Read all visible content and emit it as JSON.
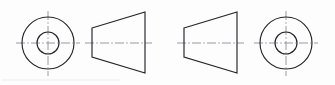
{
  "drawing": {
    "title": "Truncated cone with central bore — two orthographic projections",
    "background_color": "#fdfdfd",
    "line_color": "#24252a",
    "centerline_color": "#8e8f95",
    "canvas": {
      "width": 335,
      "height": 85
    },
    "projection_note": "Each assembly pairs an end view (concentric circles) with a profile view (trapezoid)",
    "views": [
      {
        "id": "left-end-view",
        "label": "End view — left part",
        "type": "concentric-circles",
        "center_x": 48,
        "center_y": 43,
        "outer_radius": 26,
        "inner_radius": 11,
        "centerline_h": {
          "x1": 16,
          "y1": 43,
          "x2": 80,
          "y2": 43
        },
        "centerline_v": {
          "x1": 48,
          "y1": 11,
          "x2": 48,
          "y2": 76
        }
      },
      {
        "id": "left-profile-view",
        "label": "Profile view — left part",
        "type": "trapezoid",
        "narrow_side": "left",
        "left_x": 92,
        "right_x": 145,
        "left_top_y": 28,
        "left_bottom_y": 57,
        "right_top_y": 12,
        "right_bottom_y": 73,
        "centerline_h": {
          "x1": 85,
          "y1": 43,
          "x2": 152,
          "y2": 43
        }
      },
      {
        "id": "right-profile-view",
        "label": "Profile view — right part",
        "type": "trapezoid",
        "narrow_side": "left",
        "left_x": 184,
        "right_x": 237,
        "left_top_y": 28,
        "left_bottom_y": 57,
        "right_top_y": 12,
        "right_bottom_y": 73,
        "centerline_h": {
          "x1": 177,
          "y1": 43,
          "x2": 244,
          "y2": 43
        }
      },
      {
        "id": "right-end-view",
        "label": "End view — right part",
        "type": "concentric-circles",
        "center_x": 286,
        "center_y": 43,
        "outer_radius": 26,
        "inner_radius": 11,
        "centerline_h": {
          "x1": 254,
          "y1": 43,
          "x2": 318,
          "y2": 43
        },
        "centerline_v": {
          "x1": 286,
          "y1": 11,
          "x2": 286,
          "y2": 76
        }
      }
    ],
    "scan_artifact": {
      "present": true,
      "description": "faint light-grey horizontal scan edge near bottom-left",
      "x1": 2,
      "y1": 80,
      "x2": 120,
      "y2": 80
    }
  }
}
